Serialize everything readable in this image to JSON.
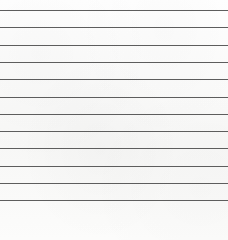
{
  "diagram": {
    "kind": "go-board-diagram",
    "board": {
      "columns": 13,
      "rows": 13,
      "visible_edges": [
        "left",
        "bottom"
      ],
      "line_color": "#5d5d5d",
      "edge_color": "#1a1a1a",
      "background_color": "#fbfbfa",
      "origin_x": 5,
      "origin_y": 10,
      "spacing": 17.3,
      "stone_diameter": 18
    },
    "hoshi": [
      {
        "col": 4,
        "row": 4
      },
      {
        "col": 10,
        "row": 4
      },
      {
        "col": 4,
        "row": 10
      },
      {
        "col": 10,
        "row": 10
      }
    ],
    "stones": [
      {
        "col": 7,
        "row": 9,
        "color": "black",
        "label": "",
        "marker": ""
      },
      {
        "col": 6,
        "row": 10,
        "color": "black",
        "label": "",
        "marker": ""
      },
      {
        "col": 9,
        "row": 10,
        "color": "black",
        "label": "",
        "marker": ""
      },
      {
        "col": 3,
        "row": 11,
        "color": "black",
        "label": "",
        "marker": ""
      },
      {
        "col": 4,
        "row": 11,
        "color": "black",
        "label": "",
        "marker": ""
      },
      {
        "col": 5,
        "row": 11,
        "color": "black",
        "label": "",
        "marker": ""
      },
      {
        "col": 6,
        "row": 11,
        "color": "black",
        "label": "",
        "marker": ""
      },
      {
        "col": 7,
        "row": 11,
        "color": "black",
        "label": "",
        "marker": ""
      },
      {
        "col": 8,
        "row": 11,
        "color": "white",
        "label": "",
        "marker": ""
      },
      {
        "col": 9,
        "row": 11,
        "color": "black",
        "label": "",
        "marker": ""
      },
      {
        "col": 10,
        "row": 11,
        "color": "black",
        "label": "",
        "marker": ""
      },
      {
        "col": 12,
        "row": 11,
        "color": "black",
        "label": "",
        "marker": ""
      },
      {
        "col": 3,
        "row": 12,
        "color": "black",
        "label": "",
        "marker": ""
      },
      {
        "col": 4,
        "row": 12,
        "color": "white",
        "label": "",
        "marker": ""
      },
      {
        "col": 5,
        "row": 12,
        "color": "white",
        "label": "",
        "marker": ""
      },
      {
        "col": 6,
        "row": 12,
        "color": "white",
        "label": "",
        "marker": ""
      },
      {
        "col": 7,
        "row": 12,
        "color": "white",
        "label": "",
        "marker": ""
      },
      {
        "col": 8,
        "row": 12,
        "color": "white",
        "label": "2",
        "marker": ""
      },
      {
        "col": 9,
        "row": 12,
        "color": "white",
        "label": "",
        "marker": ""
      },
      {
        "col": 10,
        "row": 12,
        "color": "white",
        "label": "",
        "marker": ""
      },
      {
        "col": 11,
        "row": 12,
        "color": "black",
        "label": "",
        "marker": ""
      },
      {
        "col": 4,
        "row": 13,
        "color": "black",
        "label": "3",
        "marker": ""
      },
      {
        "col": 8,
        "row": 13,
        "color": "black",
        "label": "1",
        "marker": ""
      },
      {
        "col": 10,
        "row": 13,
        "color": "white",
        "label": "",
        "marker": "triangle"
      }
    ],
    "move_labels": [
      "1",
      "2",
      "3"
    ],
    "markers": [
      "triangle"
    ]
  }
}
